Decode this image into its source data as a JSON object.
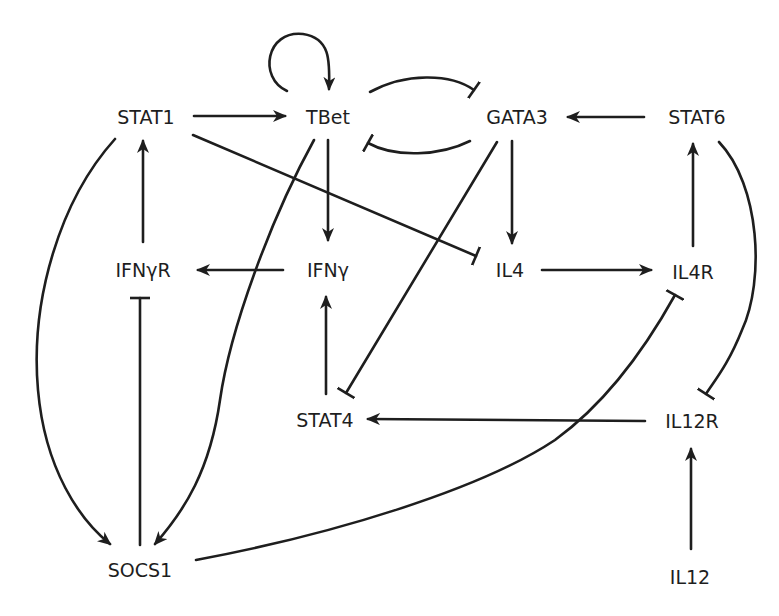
{
  "diagram": {
    "type": "gene regulatory network",
    "nodes": {
      "stat1": {
        "label": "STAT1"
      },
      "tbet": {
        "label": "TBet"
      },
      "gata3": {
        "label": "GATA3"
      },
      "stat6": {
        "label": "STAT6"
      },
      "ifngr": {
        "label": "IFNγR"
      },
      "ifng": {
        "label": "IFNγ"
      },
      "il4": {
        "label": "IL4"
      },
      "il4r": {
        "label": "IL4R"
      },
      "stat4": {
        "label": "STAT4"
      },
      "il12r": {
        "label": "IL12R"
      },
      "socs1": {
        "label": "SOCS1"
      },
      "il12": {
        "label": "IL12"
      }
    },
    "edges": [
      {
        "from": "STAT1",
        "to": "TBet",
        "type": "activation"
      },
      {
        "from": "TBet",
        "to": "TBet",
        "type": "activation"
      },
      {
        "from": "TBet",
        "to": "GATA3",
        "type": "inhibition"
      },
      {
        "from": "GATA3",
        "to": "TBet",
        "type": "inhibition"
      },
      {
        "from": "STAT6",
        "to": "GATA3",
        "type": "activation"
      },
      {
        "from": "TBet",
        "to": "IFNγ",
        "type": "activation"
      },
      {
        "from": "TBet",
        "to": "SOCS1",
        "type": "activation"
      },
      {
        "from": "STAT1",
        "to": "IL4",
        "type": "inhibition"
      },
      {
        "from": "GATA3",
        "to": "IL4",
        "type": "activation"
      },
      {
        "from": "GATA3",
        "to": "STAT4",
        "type": "inhibition"
      },
      {
        "from": "IFNγR",
        "to": "STAT1",
        "type": "activation"
      },
      {
        "from": "IFNγ",
        "to": "IFNγR",
        "type": "activation"
      },
      {
        "from": "IL4",
        "to": "IL4R",
        "type": "activation"
      },
      {
        "from": "IL4R",
        "to": "STAT6",
        "type": "activation"
      },
      {
        "from": "STAT6",
        "to": "IL12R",
        "type": "inhibition"
      },
      {
        "from": "STAT4",
        "to": "IFNγ",
        "type": "activation"
      },
      {
        "from": "IL12R",
        "to": "STAT4",
        "type": "activation"
      },
      {
        "from": "IL12",
        "to": "IL12R",
        "type": "activation"
      },
      {
        "from": "STAT1",
        "to": "SOCS1",
        "type": "activation"
      },
      {
        "from": "SOCS1",
        "to": "IFNγR",
        "type": "inhibition"
      },
      {
        "from": "SOCS1",
        "to": "IL4R",
        "type": "inhibition"
      }
    ]
  }
}
